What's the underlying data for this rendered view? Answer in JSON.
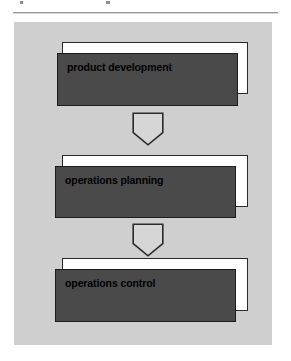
{
  "page": {
    "background_color": "#ffffff",
    "panel_color": "#cfcfcf",
    "box_fill_color": "#4a4a4a",
    "box_border_color": "#1c1c1c",
    "shadow_box_color": "#ffffff",
    "arrow_fill_color": "#d6d6d6",
    "arrow_border_color": "#2b2b2b",
    "text_color": "#000000"
  },
  "diagram": {
    "type": "vertical-flowchart",
    "orientation": "top-to-bottom",
    "node_count": 3,
    "connector_count": 2,
    "nodes": [
      {
        "id": "node-1",
        "label": "product development",
        "order": 1
      },
      {
        "id": "node-2",
        "label": "operations planning",
        "order": 2
      },
      {
        "id": "node-3",
        "label": "operations control",
        "order": 3
      }
    ],
    "connectors": [
      {
        "id": "arrow-1",
        "shape": "pentagon-down",
        "from": "node-1",
        "to": "node-2"
      },
      {
        "id": "arrow-2",
        "shape": "pentagon-down",
        "from": "node-2",
        "to": "node-3"
      }
    ]
  }
}
